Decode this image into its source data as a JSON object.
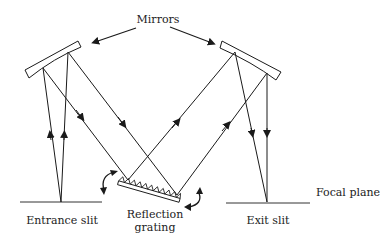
{
  "diagram": {
    "labels": {
      "mirrors": "Mirrors",
      "entrance_slit": "Entrance slit",
      "reflection_grating_line1": "Reflection",
      "reflection_grating_line2": "grating",
      "exit_slit": "Exit slit",
      "focal_plane": "Focal plane"
    },
    "components": [
      {
        "id": "left-mirror",
        "type": "concave mirror"
      },
      {
        "id": "right-mirror",
        "type": "concave mirror"
      },
      {
        "id": "entrance-slit",
        "type": "slit"
      },
      {
        "id": "exit-slit",
        "type": "slit"
      },
      {
        "id": "reflection-grating",
        "type": "rotatable reflection grating"
      }
    ],
    "colors": {
      "stroke": "#1a1a1a",
      "text": "#222222",
      "background": "#ffffff"
    }
  }
}
